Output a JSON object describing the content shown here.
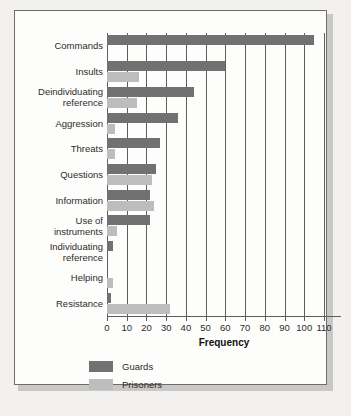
{
  "chart_data": {
    "type": "bar",
    "orientation": "horizontal",
    "title": "",
    "xlabel": "Frequency",
    "ylabel": "",
    "xlim": [
      0,
      110
    ],
    "xticks": [
      0,
      10,
      20,
      30,
      40,
      50,
      60,
      70,
      80,
      90,
      100,
      110
    ],
    "grid": "vertical",
    "legend_position": "bottom-left",
    "categories": [
      "Commands",
      "Insults",
      "Deindividuating reference",
      "Aggression",
      "Threats",
      "Questions",
      "Information",
      "Use of instruments",
      "Individuating reference",
      "Helping",
      "Resistance"
    ],
    "category_lines": [
      [
        "Commands"
      ],
      [
        "Insults"
      ],
      [
        "Deindividuating",
        "reference"
      ],
      [
        "Aggression"
      ],
      [
        "Threats"
      ],
      [
        "Questions"
      ],
      [
        "Information"
      ],
      [
        "Use of",
        "instruments"
      ],
      [
        "Individuating",
        "reference"
      ],
      [
        "Helping"
      ],
      [
        "Resistance"
      ]
    ],
    "series": [
      {
        "name": "Guards",
        "color": "#717171",
        "values": [
          105,
          60,
          44,
          36,
          27,
          25,
          22,
          22,
          3,
          0,
          2
        ]
      },
      {
        "name": "Prisoners",
        "color": "#bdbdbd",
        "values": [
          0,
          16,
          15,
          4,
          4,
          23,
          24,
          5,
          0,
          3,
          32
        ]
      }
    ]
  },
  "legend": {
    "items": [
      {
        "label": "Guards",
        "color": "#717171"
      },
      {
        "label": "Prisoners",
        "color": "#bdbdbd"
      }
    ]
  },
  "colors": {
    "guards": "#717171",
    "prisoners": "#bdbdbd",
    "axis": "#5e5e5e",
    "card_border": "#6d6d6d",
    "card_background": "#fdfdfc",
    "page_background": "#f2f1ef",
    "text": "#2b2b2b"
  }
}
